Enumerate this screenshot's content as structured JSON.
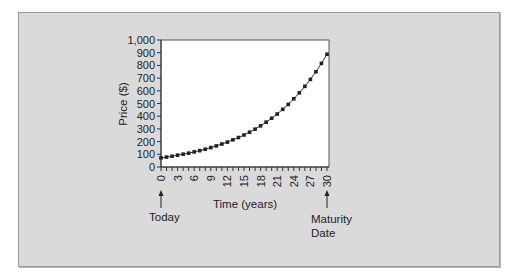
{
  "chart_data": {
    "type": "line",
    "title": "",
    "xlabel": "Time (years)",
    "ylabel": "Price ($)",
    "xlim": [
      0,
      30
    ],
    "ylim": [
      0,
      1000
    ],
    "grid": false,
    "legend": null,
    "x_ticks": [
      0,
      3,
      6,
      9,
      12,
      15,
      18,
      21,
      24,
      27,
      30
    ],
    "y_ticks": [
      0,
      100,
      200,
      300,
      400,
      500,
      600,
      700,
      800,
      900,
      1000
    ],
    "y_tick_labels": [
      "0",
      "100",
      "200",
      "300",
      "400",
      "500",
      "600",
      "700",
      "800",
      "900",
      "1,000"
    ],
    "x": [
      0,
      1,
      2,
      3,
      4,
      5,
      6,
      7,
      8,
      9,
      10,
      11,
      12,
      13,
      14,
      15,
      16,
      17,
      18,
      19,
      20,
      21,
      22,
      23,
      24,
      25,
      26,
      27,
      28,
      29,
      30
    ],
    "series": [
      {
        "name": "Price",
        "marker": "square",
        "values": [
          72,
          78,
          85,
          93,
          101,
          109,
          119,
          129,
          140,
          153,
          166,
          181,
          196,
          214,
          232,
          252,
          274,
          298,
          324,
          353,
          384,
          417,
          454,
          493,
          537,
          584,
          635,
          690,
          750,
          816,
          888
        ]
      }
    ],
    "annotations": [
      {
        "x": 0,
        "text": "Today",
        "arrow": "up"
      },
      {
        "x": 30,
        "text": "Maturity Date",
        "lines": [
          "Maturity",
          "Date"
        ],
        "arrow": "up"
      }
    ]
  },
  "labels": {
    "today": "Today",
    "maturity_line1": "Maturity",
    "maturity_line2": "Date",
    "xlabel": "Time (years)",
    "ylabel": "Price ($)"
  },
  "colors": {
    "frame_bg": "#dadada",
    "plot_bg": "#ffffff",
    "line": "#333333",
    "marker": "#222222"
  }
}
